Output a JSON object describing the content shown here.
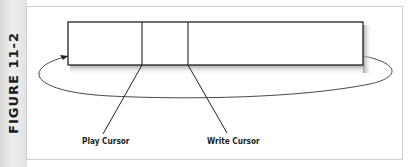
{
  "figure": {
    "label": "FIGURE 11-2"
  },
  "diagram": {
    "labels": {
      "play_cursor": "Play Cursor",
      "write_cursor": "Write Cursor"
    },
    "colors": {
      "line": "#222222",
      "sidebar": "#e6e6e6",
      "panel_border": "#cfcfcf"
    }
  }
}
